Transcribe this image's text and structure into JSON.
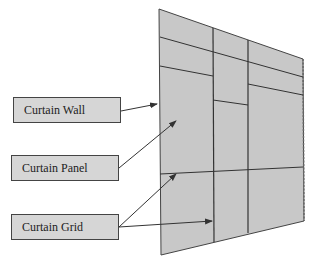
{
  "diagram": {
    "title": "",
    "labels": [
      {
        "id": "curtain-wall",
        "text": "Curtain Wall"
      },
      {
        "id": "curtain-panel",
        "text": "Curtain Panel"
      },
      {
        "id": "curtain-grid",
        "text": "Curtain Grid"
      }
    ],
    "colors": {
      "wall_fill": "#c8c8c8",
      "label_fill": "#d6d6d6",
      "line": "#333333"
    }
  }
}
